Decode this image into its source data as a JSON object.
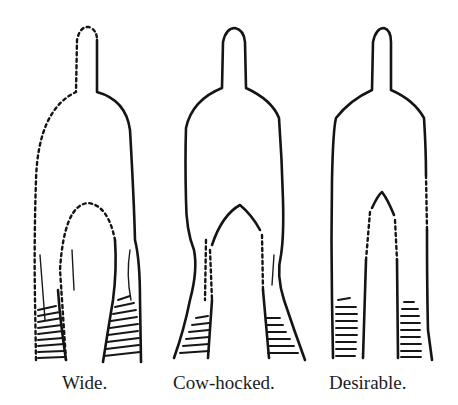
{
  "figures": [
    {
      "id": "wide",
      "label": "Wide."
    },
    {
      "id": "cow-hocked",
      "label": "Cow-hocked."
    },
    {
      "id": "desirable",
      "label": "Desirable."
    }
  ],
  "colors": {
    "ink": "#141414",
    "background": "#ffffff"
  }
}
